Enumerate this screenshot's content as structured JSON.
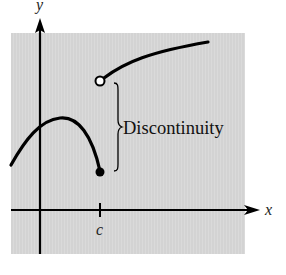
{
  "diagram": {
    "type": "function-graph",
    "background_color": "#d4d4d4",
    "axes": {
      "x_label": "x",
      "y_label": "y",
      "tick_label": "c"
    },
    "annotation": {
      "label": "Discontinuity"
    },
    "points": {
      "closed": "filled point at x = c (lower piece endpoint)",
      "open": "open point at x = c (upper piece start)"
    }
  }
}
